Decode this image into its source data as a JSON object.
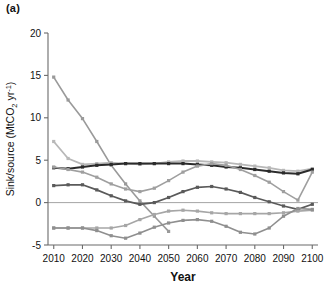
{
  "panel": {
    "label": "(a)"
  },
  "chart_data": {
    "type": "line",
    "title": "",
    "xlabel": "Year",
    "ylabel": "Sink/source (MtCO₂ yr⁻¹)",
    "ylabel_parts": {
      "pre": "Sink/source (MtCO",
      "sub": "2",
      "mid": " yr",
      "sup": "-1",
      "post": ")"
    },
    "x": [
      2010,
      2015,
      2020,
      2025,
      2030,
      2035,
      2040,
      2045,
      2050,
      2055,
      2060,
      2065,
      2070,
      2075,
      2080,
      2085,
      2090,
      2095,
      2100
    ],
    "xlim": [
      2008,
      2102
    ],
    "ylim": [
      -5,
      20
    ],
    "xticks": [
      2010,
      2020,
      2030,
      2040,
      2050,
      2060,
      2070,
      2080,
      2090,
      2100
    ],
    "xtick_labels": [
      "2010",
      "2020",
      "2030",
      "2040",
      "2050",
      "2060",
      "2070",
      "2080",
      "2090",
      "2100"
    ],
    "yticks": [
      -5,
      0,
      5,
      10,
      15,
      20
    ],
    "ytick_labels": [
      "-5",
      "0",
      "5",
      "10",
      "15",
      "20"
    ],
    "grid": false,
    "zero_line": true,
    "marker": "square",
    "series": [
      {
        "name": "steep-decline",
        "color": "#9a9a9a",
        "width": 1.6,
        "values": [
          14.8,
          12.1,
          9.9,
          7.2,
          4.4,
          2.2,
          0.2,
          -1.6,
          -3.4,
          null,
          null,
          null,
          null,
          null,
          null,
          null,
          null,
          null,
          null
        ]
      },
      {
        "name": "light-gray-upper",
        "color": "#b8b8b8",
        "width": 1.8,
        "values": [
          7.2,
          5.2,
          4.5,
          4.6,
          4.7,
          4.6,
          4.5,
          4.6,
          4.8,
          4.9,
          4.9,
          4.8,
          4.7,
          4.5,
          4.3,
          4.1,
          3.8,
          3.7,
          4.0
        ]
      },
      {
        "name": "dark-band",
        "color": "#2b2b2b",
        "width": 2.0,
        "values": [
          4.1,
          4.0,
          4.2,
          4.4,
          4.5,
          4.6,
          4.6,
          4.6,
          4.6,
          4.6,
          4.5,
          4.4,
          4.2,
          4.1,
          3.9,
          3.7,
          3.5,
          3.4,
          3.9
        ]
      },
      {
        "name": "mid-dip-gray",
        "color": "#9f9f9f",
        "width": 1.6,
        "values": [
          4.2,
          3.9,
          3.6,
          3.0,
          2.2,
          1.6,
          1.3,
          1.7,
          2.6,
          3.6,
          4.3,
          4.6,
          4.4,
          3.9,
          3.2,
          2.4,
          1.3,
          0.3,
          3.6
        ]
      },
      {
        "name": "mid-lower-dark",
        "color": "#5a5a5a",
        "width": 1.7,
        "values": [
          2.0,
          2.1,
          2.1,
          1.5,
          0.8,
          0.2,
          -0.2,
          0.0,
          0.6,
          1.3,
          1.8,
          1.9,
          1.6,
          1.2,
          0.6,
          0.1,
          -0.4,
          -0.8,
          -0.2
        ]
      },
      {
        "name": "flat-low-gray",
        "color": "#a6a6a6",
        "width": 1.6,
        "values": [
          -3.0,
          -3.0,
          -3.0,
          -3.0,
          -3.0,
          -2.7,
          -2.0,
          -1.4,
          -1.0,
          -0.9,
          -1.0,
          -1.2,
          -1.3,
          -1.3,
          -1.3,
          -1.3,
          -1.2,
          -1.0,
          -0.9
        ]
      },
      {
        "name": "deep-dip-gray",
        "color": "#8f8f8f",
        "width": 1.6,
        "values": [
          -3.0,
          -3.0,
          -3.0,
          -3.3,
          -3.9,
          -4.2,
          -3.6,
          -2.9,
          -2.4,
          -2.1,
          -2.0,
          -2.2,
          -2.8,
          -3.5,
          -3.7,
          -3.0,
          -1.6,
          -0.7,
          -0.8
        ]
      }
    ]
  }
}
